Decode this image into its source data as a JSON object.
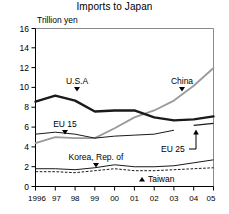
{
  "chart_data": {
    "type": "line",
    "title": "Imports to Japan",
    "ylabel": "Trillion yen",
    "xlabel": "",
    "x": [
      "1996",
      "97",
      "98",
      "99",
      "00",
      "01",
      "02",
      "03",
      "04",
      "05"
    ],
    "ylim": [
      0,
      16
    ],
    "yticks": [
      0,
      2,
      4,
      6,
      8,
      10,
      12,
      14,
      16
    ],
    "grid": false,
    "legend": "inline-labels",
    "series": [
      {
        "name": "U.S.A",
        "style": "thick-black",
        "values": [
          8.6,
          9.2,
          8.7,
          7.6,
          7.7,
          7.7,
          7.0,
          6.7,
          6.8,
          7.1
        ]
      },
      {
        "name": "China",
        "style": "gray",
        "values": [
          4.4,
          5.0,
          4.9,
          4.9,
          5.9,
          7.0,
          7.7,
          8.7,
          10.2,
          12.0
        ]
      },
      {
        "name": "EU 15",
        "style": "thin-black",
        "values": [
          5.3,
          5.5,
          5.3,
          4.9,
          5.1,
          5.2,
          5.3,
          5.7,
          null,
          null
        ]
      },
      {
        "name": "EU 25",
        "style": "thin-black-segment",
        "values": [
          null,
          null,
          null,
          null,
          null,
          null,
          null,
          null,
          6.2,
          6.4
        ]
      },
      {
        "name": "Korea, Rep. of",
        "style": "thin-black",
        "values": [
          1.8,
          1.8,
          1.7,
          1.9,
          2.2,
          2.0,
          2.0,
          2.1,
          2.4,
          2.7
        ]
      },
      {
        "name": "Taiwan",
        "style": "dashed-black",
        "values": [
          1.5,
          1.5,
          1.4,
          1.6,
          1.8,
          1.6,
          1.6,
          1.7,
          1.8,
          1.9
        ]
      }
    ],
    "annotations": [
      {
        "text": "U.S.A",
        "marker": "triangle-down"
      },
      {
        "text": "China",
        "marker": "triangle-down"
      },
      {
        "text": "EU 15",
        "marker": "triangle-down"
      },
      {
        "text": "EU 25",
        "marker": "leader-arrow-up"
      },
      {
        "text": "Korea, Rep. of",
        "marker": "triangle-down"
      },
      {
        "text": "Taiwan",
        "marker": "triangle-up"
      }
    ]
  },
  "labels": {
    "y0": "0",
    "y2": "2",
    "y4": "4",
    "y6": "6",
    "y8": "8",
    "y10": "10",
    "y12": "12",
    "y14": "14",
    "y16": "16",
    "x0": "1996",
    "x1": "97",
    "x2": "98",
    "x3": "99",
    "x4": "00",
    "x5": "01",
    "x6": "02",
    "x7": "03",
    "x8": "04",
    "x9": "05"
  }
}
